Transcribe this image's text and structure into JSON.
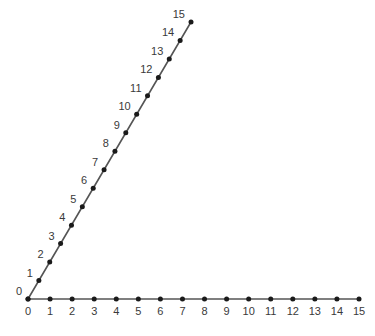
{
  "chart_data": {
    "type": "scatter",
    "title": "",
    "xlabel": "",
    "ylabel": "",
    "grid": false,
    "legend": null,
    "background_color": "#ffffff",
    "line_color": "#555555",
    "marker_color": "#1a1a1a",
    "label_color": "#3a3a3a",
    "series": [
      {
        "name": "horizontal-axis-number-line",
        "orientation": "horizontal",
        "point_labels": [
          "0",
          "1",
          "2",
          "3",
          "4",
          "5",
          "6",
          "7",
          "8",
          "9",
          "10",
          "11",
          "12",
          "13",
          "14",
          "15"
        ],
        "values": [
          0,
          1,
          2,
          3,
          4,
          5,
          6,
          7,
          8,
          9,
          10,
          11,
          12,
          13,
          14,
          15
        ],
        "label_position": "below",
        "start_px": [
          28,
          299
        ],
        "end_px": [
          359,
          299
        ]
      },
      {
        "name": "diagonal-ray-number-line",
        "orientation": "diagonal",
        "point_labels": [
          "0",
          "1",
          "2",
          "3",
          "4",
          "5",
          "6",
          "7",
          "8",
          "9",
          "10",
          "11",
          "12",
          "13",
          "14",
          "15"
        ],
        "values": [
          0,
          1,
          2,
          3,
          4,
          5,
          6,
          7,
          8,
          9,
          10,
          11,
          12,
          13,
          14,
          15
        ],
        "label_position": "upper-left",
        "start_px": [
          28,
          299
        ],
        "end_px": [
          191,
          22
        ]
      }
    ],
    "xlim": [
      0,
      15
    ],
    "ylim": [
      0,
      15
    ]
  }
}
